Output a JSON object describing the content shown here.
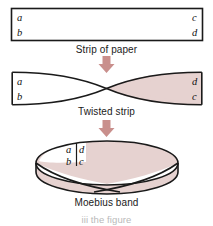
{
  "figure": {
    "background": "#ffffff",
    "stroke": "#1a1a1a",
    "shade_color": "#e6d2d0",
    "arrow_color": "#c98f8c",
    "label_color": "#111111",
    "caption_color": "#1a1a1a"
  },
  "captions": {
    "strip": "Strip of paper",
    "twisted": "Twisted strip",
    "moebius": "Moebius band",
    "footer": "iii the figure"
  },
  "stages": [
    {
      "id": "strip-of-paper",
      "name": "Strip of paper",
      "shaded": false,
      "labels": [
        {
          "text": "a",
          "corner": "top-left"
        },
        {
          "text": "b",
          "corner": "bottom-left"
        },
        {
          "text": "c",
          "corner": "top-right"
        },
        {
          "text": "d",
          "corner": "bottom-right"
        }
      ]
    },
    {
      "id": "twisted-strip",
      "name": "Twisted strip",
      "shaded": true,
      "labels": [
        {
          "text": "a",
          "corner": "top-left"
        },
        {
          "text": "b",
          "corner": "bottom-left"
        },
        {
          "text": "d",
          "corner": "top-right"
        },
        {
          "text": "c",
          "corner": "bottom-right"
        }
      ]
    },
    {
      "id": "moebius-band",
      "name": "Moebius band",
      "shaded": true,
      "labels": [
        {
          "text": "a",
          "corner": "seam-top-left"
        },
        {
          "text": "d",
          "corner": "seam-top-right"
        },
        {
          "text": "b",
          "corner": "seam-bottom-left"
        },
        {
          "text": "c",
          "corner": "seam-bottom-right"
        }
      ]
    }
  ],
  "arrows": [
    {
      "id": "arrow-strip-to-twisted",
      "direction": "down"
    },
    {
      "id": "arrow-twisted-to-moebius",
      "direction": "down"
    }
  ],
  "strip_labels": {
    "s1_tl": "a",
    "s1_bl": "b",
    "s1_tr": "c",
    "s1_br": "d",
    "s2_tl": "a",
    "s2_bl": "b",
    "s2_tr": "d",
    "s2_br": "c",
    "s3_tl": "a",
    "s3_tr": "d",
    "s3_bl": "b",
    "s3_br": "c"
  }
}
